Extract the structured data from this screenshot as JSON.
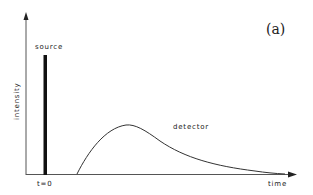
{
  "figure": {
    "panel_label": "(a)",
    "axes": {
      "y_label": "intensity",
      "x_label": "time",
      "origin_tick_label": "t=0"
    },
    "series": [
      {
        "name": "source",
        "label": "source",
        "shape": "narrow pulse at t=0"
      },
      {
        "name": "detector",
        "label": "detector",
        "shape": "delayed broadened pulse with long tail"
      }
    ],
    "colors": {
      "ink": "#222222",
      "background": "#ffffff"
    }
  }
}
